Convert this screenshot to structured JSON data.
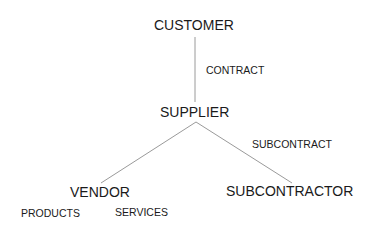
{
  "nodes": {
    "customer": "CUSTOMER",
    "supplier": "SUPPLIER",
    "vendor": "VENDOR",
    "subcontractor": "SUBCONTRACTOR"
  },
  "edges": {
    "customer_supplier": "CONTRACT",
    "supplier_subcontractor": "SUBCONTRACT"
  },
  "vendor_items": [
    "PRODUCTS",
    "SERVICES"
  ],
  "colors": {
    "line": "#9a9a9a",
    "text": "#1a1a1a"
  }
}
